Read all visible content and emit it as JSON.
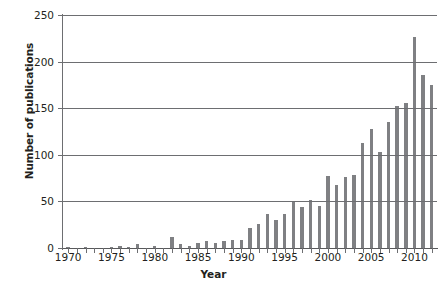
{
  "chart_data": {
    "type": "bar",
    "title": "",
    "xlabel": "Year",
    "ylabel": "Number of publications",
    "ylim": [
      0,
      250
    ],
    "yticks": [
      0,
      50,
      100,
      150,
      200,
      250
    ],
    "xlim": [
      1969.4,
      2012.6
    ],
    "xticks": [
      1970,
      1975,
      1980,
      1985,
      1990,
      1995,
      2000,
      2005,
      2010
    ],
    "xtick_labels": [
      "1970",
      "1975",
      "1980",
      "1985",
      "1990",
      "1995",
      "2000",
      "2005",
      "2010"
    ],
    "grid": "horizontal",
    "legend": "none",
    "bar_color": "#7f8083",
    "axis_color": "#6d6e71",
    "categories": [
      1970,
      1971,
      1972,
      1973,
      1974,
      1975,
      1976,
      1977,
      1978,
      1979,
      1980,
      1981,
      1982,
      1983,
      1984,
      1985,
      1986,
      1987,
      1988,
      1989,
      1990,
      1991,
      1992,
      1993,
      1994,
      1995,
      1996,
      1997,
      1998,
      1999,
      2000,
      2001,
      2002,
      2003,
      2004,
      2005,
      2006,
      2007,
      2008,
      2009,
      2010,
      2011,
      2012
    ],
    "values": [
      1,
      0,
      1,
      0,
      0,
      1,
      2,
      1,
      4,
      0,
      2,
      0,
      12,
      4,
      2,
      5,
      7,
      5,
      8,
      9,
      9,
      22,
      26,
      36,
      30,
      36,
      49,
      44,
      51,
      45,
      77,
      68,
      76,
      78,
      113,
      128,
      103,
      135,
      152,
      156,
      226,
      186,
      175
    ]
  }
}
